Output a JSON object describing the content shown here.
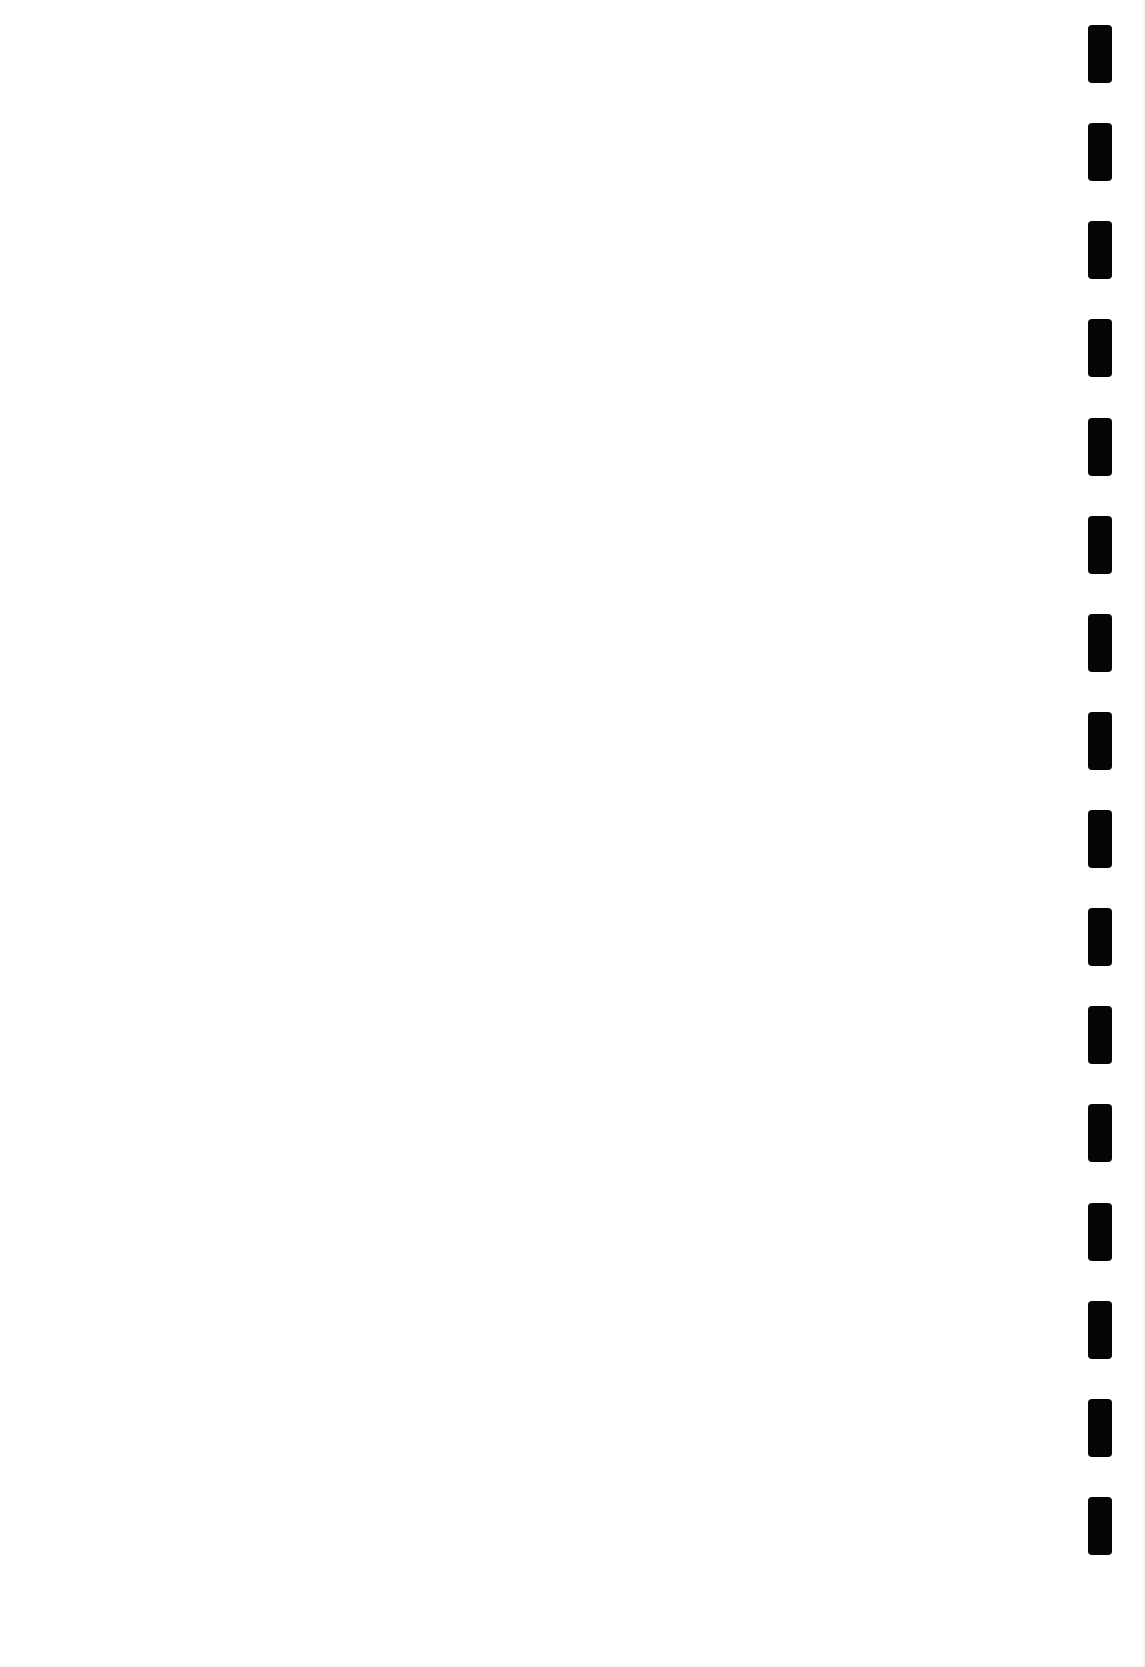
{
  "page": {
    "background_color": "#ffffff",
    "content_text": ""
  },
  "binding": {
    "hole_color": "#050505",
    "hole_count": 16,
    "holes": [
      {
        "top": 25
      },
      {
        "top": 123
      },
      {
        "top": 221
      },
      {
        "top": 319
      },
      {
        "top": 418
      },
      {
        "top": 516
      },
      {
        "top": 614
      },
      {
        "top": 712
      },
      {
        "top": 810
      },
      {
        "top": 908
      },
      {
        "top": 1006
      },
      {
        "top": 1104
      },
      {
        "top": 1203
      },
      {
        "top": 1301
      },
      {
        "top": 1399
      },
      {
        "top": 1497
      }
    ]
  }
}
